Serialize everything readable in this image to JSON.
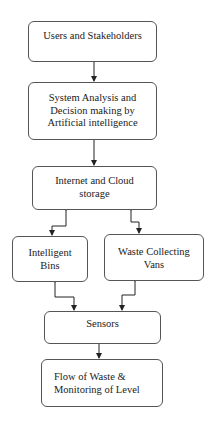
{
  "diagram": {
    "nodes": [
      {
        "id": "users",
        "label": "Users and Stakeholders"
      },
      {
        "id": "ai",
        "label": "System Analysis and Decision making by Artificial intelligence",
        "lines": [
          "System Analysis and",
          "Decision making by",
          "Artificial intelligence"
        ]
      },
      {
        "id": "cloud",
        "label": "Internet and Cloud storage",
        "lines": [
          "Internet and Cloud",
          "storage"
        ]
      },
      {
        "id": "bins",
        "label": "Intelligent Bins",
        "lines": [
          "Intelligent",
          "Bins"
        ]
      },
      {
        "id": "vans",
        "label": "Waste Collecting Vans",
        "lines": [
          "Waste Collecting",
          "Vans"
        ]
      },
      {
        "id": "sensors",
        "label": "Sensors"
      },
      {
        "id": "flow",
        "label": "Flow of Waste & Monitoring of Level",
        "lines": [
          "Flow of Waste &",
          "Monitoring of Level"
        ]
      }
    ],
    "edges": [
      {
        "from": "users",
        "to": "ai",
        "type": "one-way"
      },
      {
        "from": "ai",
        "to": "cloud",
        "type": "one-way"
      },
      {
        "from": "cloud",
        "to": "bins",
        "type": "two-way"
      },
      {
        "from": "cloud",
        "to": "vans",
        "type": "two-way"
      },
      {
        "from": "bins",
        "to": "sensors",
        "type": "two-way"
      },
      {
        "from": "vans",
        "to": "sensors",
        "type": "two-way"
      },
      {
        "from": "sensors",
        "to": "flow",
        "type": "one-way"
      }
    ]
  }
}
